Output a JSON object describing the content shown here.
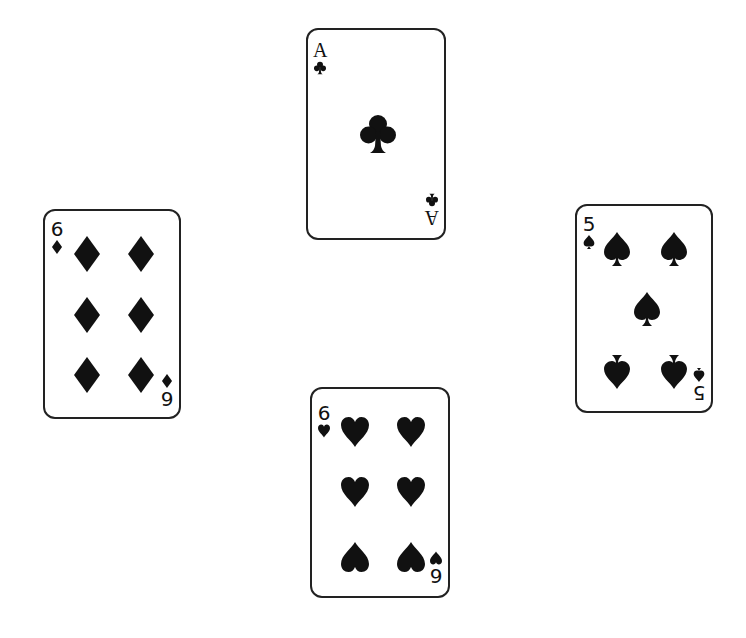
{
  "table": {
    "background": "#ffffff",
    "ink_color": "#111111"
  },
  "cards": [
    {
      "position": "top",
      "rank": "A",
      "suit": "clubs",
      "suit_icon": "club-icon",
      "pip_count": 1
    },
    {
      "position": "left",
      "rank": "6",
      "suit": "diamonds",
      "suit_icon": "diamond-icon",
      "pip_count": 6
    },
    {
      "position": "right",
      "rank": "5",
      "suit": "spades",
      "suit_icon": "spade-icon",
      "pip_count": 5
    },
    {
      "position": "bottom",
      "rank": "6",
      "suit": "hearts",
      "suit_icon": "heart-icon",
      "pip_count": 6
    }
  ]
}
